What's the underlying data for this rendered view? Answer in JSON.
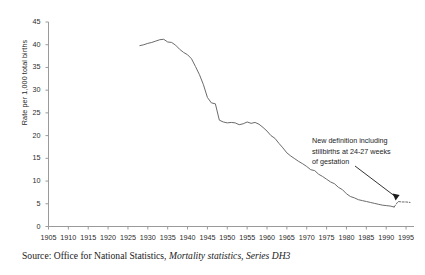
{
  "chart_data": {
    "type": "line",
    "title": "",
    "xlabel": "",
    "ylabel": "Rate per 1,000 total births",
    "xlim": [
      1905,
      1997
    ],
    "ylim": [
      0,
      45
    ],
    "grid": false,
    "legend": false,
    "xticks": [
      1905,
      1910,
      1915,
      1920,
      1925,
      1930,
      1935,
      1940,
      1945,
      1950,
      1955,
      1960,
      1965,
      1970,
      1975,
      1980,
      1985,
      1990,
      1995
    ],
    "yticks": [
      0,
      5,
      10,
      15,
      20,
      25,
      30,
      35,
      40,
      45
    ],
    "series": [
      {
        "name": "Stillbirth rate",
        "x": [
          1928,
          1929,
          1930,
          1931,
          1932,
          1933,
          1934,
          1935,
          1936,
          1937,
          1938,
          1939,
          1940,
          1941,
          1942,
          1943,
          1944,
          1945,
          1946,
          1947,
          1948,
          1949,
          1950,
          1951,
          1952,
          1953,
          1954,
          1955,
          1956,
          1957,
          1958,
          1959,
          1960,
          1961,
          1962,
          1963,
          1964,
          1965,
          1966,
          1967,
          1968,
          1969,
          1970,
          1971,
          1972,
          1973,
          1974,
          1975,
          1976,
          1977,
          1978,
          1979,
          1980,
          1981,
          1982,
          1983,
          1984,
          1985,
          1986,
          1987,
          1988,
          1989,
          1990,
          1991,
          1992
        ],
        "values": [
          39.8,
          40.0,
          40.3,
          40.5,
          40.8,
          41.1,
          41.2,
          40.6,
          40.5,
          39.9,
          39.0,
          38.3,
          37.8,
          36.9,
          35.2,
          33.4,
          31.2,
          28.4,
          27.2,
          27.0,
          23.4,
          23.0,
          22.8,
          22.9,
          22.8,
          22.4,
          22.6,
          23.0,
          22.7,
          22.9,
          22.5,
          21.8,
          21.0,
          20.0,
          19.4,
          18.3,
          17.3,
          16.2,
          15.5,
          14.9,
          14.3,
          13.8,
          13.2,
          12.5,
          12.3,
          11.5,
          11.0,
          10.4,
          9.8,
          9.4,
          8.6,
          8.1,
          7.2,
          6.6,
          6.3,
          5.9,
          5.7,
          5.5,
          5.3,
          5.1,
          4.9,
          4.7,
          4.6,
          4.5,
          4.3
        ],
        "color": "#6b6b6b"
      },
      {
        "name": "Stillbirth rate (new definition)",
        "x": [
          1992,
          1993,
          1994,
          1995,
          1996
        ],
        "values": [
          4.3,
          5.5,
          5.4,
          5.4,
          5.3
        ],
        "color": "#6b6b6b",
        "style": "dashed"
      }
    ],
    "annotations": [
      {
        "text": "New definition including stillbirths at 24-27 weeks of gestation",
        "line1": "New definition including",
        "line2": "stillbirths at 24-27 weeks",
        "line3": "of gestation",
        "points_to_year": 1993,
        "points_to_value": 5.5
      }
    ]
  },
  "source": {
    "prefix": "Source: Office for National Statistics, ",
    "italic": "Mortality statistics, Series DH3"
  },
  "colors": {
    "axis": "#9a9a9a",
    "line": "#6b6b6b",
    "text": "#1a1a1a"
  }
}
